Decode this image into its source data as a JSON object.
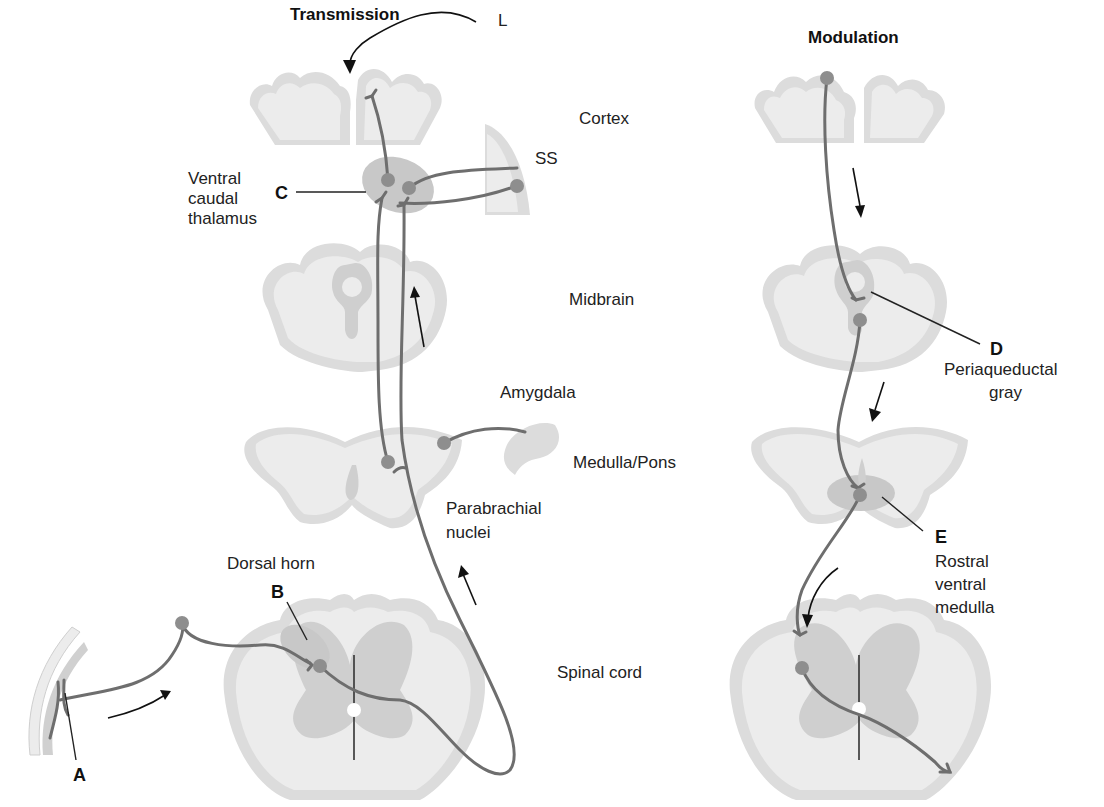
{
  "titles": {
    "transmission": "Transmission",
    "modulation": "Modulation"
  },
  "levels": {
    "cortex": "Cortex",
    "midbrain": "Midbrain",
    "medulla_pons": "Medulla/Pons",
    "spinal_cord": "Spinal cord"
  },
  "structures": {
    "ss": "SS",
    "thalamus": [
      "Ventral",
      "caudal",
      "thalamus"
    ],
    "amygdala": "Amygdala",
    "parabrachial": [
      "Parabrachial",
      "nuclei"
    ],
    "dorsal_horn": "Dorsal horn",
    "periaqueductal": [
      "Periaqueductal",
      "gray"
    ],
    "rostral_ventral_medulla": [
      "Rostral",
      "ventral",
      "medulla"
    ]
  },
  "letters": {
    "A": "A",
    "B": "B",
    "C": "C",
    "D": "D",
    "E": "E",
    "L": "L"
  },
  "colors": {
    "tissue_outer": "#dcdcdc",
    "tissue_inner": "#ececec",
    "gray_matter": "#cfcfcf",
    "soma": "#8e8e8e",
    "axon": "#6e6e6e"
  }
}
